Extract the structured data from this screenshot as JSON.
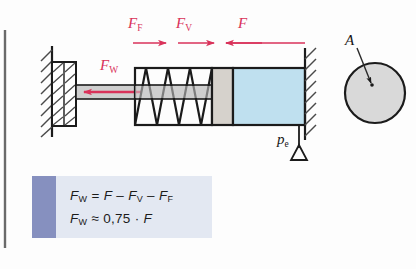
{
  "figure": {
    "labels": {
      "force_friction": "F",
      "force_friction_sub": "F",
      "force_spring": "F",
      "force_spring_sub": "V",
      "force_applied": "F",
      "force_effective": "F",
      "force_effective_sub": "W",
      "pressure": "p",
      "pressure_sub": "e",
      "area": "A"
    },
    "colors": {
      "arrow_red": "#d9325a",
      "fluid_blue": "#bfe0ef",
      "piston_gray": "#d6d2cc",
      "rod_gray": "#cfcfcf",
      "circle_gray": "#d9d9d9",
      "line_black": "#1b1b1b",
      "box_body": "#e3e8f2",
      "box_stripe": "#8690bf",
      "page_rule": "#555555"
    },
    "formula_box": {
      "line1": {
        "lhs_var": "F",
        "lhs_sub": "W",
        "eq": "=",
        "t1_var": "F",
        "op1": "–",
        "t2_var": "F",
        "t2_sub": "V",
        "op2": "–",
        "t3_var": "F",
        "t3_sub": "F"
      },
      "line2": {
        "lhs_var": "F",
        "lhs_sub": "W",
        "approx": "≈",
        "value": "0,75",
        "dot": "·",
        "rhs_var": "F"
      }
    },
    "elements": {
      "wall_left": "fixed-wall-left",
      "wall_right": "fixed-wall-right",
      "block": "hatched-abutment-block",
      "rod": "piston-rod",
      "spring": "coil-spring",
      "piston": "piston",
      "fluid": "pressurised-fluid-chamber",
      "port_symbol": "pressure-port-triangle",
      "area_circle": "piston-area-circle"
    }
  }
}
